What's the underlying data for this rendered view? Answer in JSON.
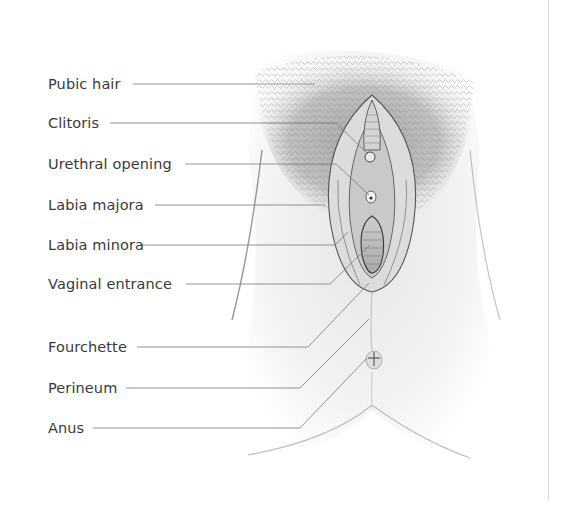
{
  "figure": {
    "type": "labeled anatomical illustration",
    "labels": [
      {
        "text": "Pubic hair",
        "y": 75
      },
      {
        "text": "Clitoris",
        "y": 114
      },
      {
        "text": "Urethral opening",
        "y": 155
      },
      {
        "text": "Labia majora",
        "y": 196
      },
      {
        "text": "Labia minora",
        "y": 236
      },
      {
        "text": "Vaginal entrance",
        "y": 275
      },
      {
        "text": "Fourchette",
        "y": 338
      },
      {
        "text": "Perineum",
        "y": 379
      },
      {
        "text": "Anus",
        "y": 419
      }
    ],
    "colors": {
      "label_text": "#3a3a3a",
      "leader_line": "#7a7a7a",
      "illustration_shade": "#8c8c8c",
      "divider": "#d6d6d6"
    }
  }
}
